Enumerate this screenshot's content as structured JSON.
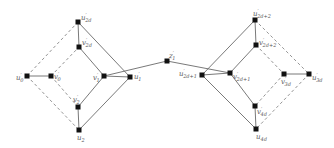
{
  "diagram": {
    "type": "graph",
    "colors": {
      "edge": "#6a6a6a",
      "dashed_edge": "#8a8a8a",
      "node": "#111111",
      "label": "#555555"
    },
    "nodes": [
      {
        "id": "u0p",
        "x": 27,
        "y": 76,
        "label": {
          "base": "u",
          "prime": "′",
          "sub": "0"
        },
        "lx": 16,
        "ly": 80,
        "anchor": "end-ish"
      },
      {
        "id": "v0p",
        "x": 51,
        "y": 76,
        "label": {
          "base": "v",
          "prime": "′",
          "sub": "0"
        },
        "lx": 54,
        "ly": 79
      },
      {
        "id": "u2dp",
        "x": 78,
        "y": 22,
        "label": {
          "base": "u",
          "prime": "′",
          "sub": "2d"
        },
        "lx": 81,
        "ly": 20
      },
      {
        "id": "v2dp",
        "x": 79,
        "y": 47,
        "label": {
          "base": "v",
          "prime": "′",
          "sub": "2d"
        },
        "lx": 82,
        "ly": 45
      },
      {
        "id": "v2p",
        "x": 78,
        "y": 107,
        "label": {
          "base": "v",
          "prime": "′",
          "sub": "2"
        },
        "lx": 73,
        "ly": 102
      },
      {
        "id": "u2",
        "x": 79,
        "y": 130,
        "label": {
          "base": "u",
          "prime": "",
          "sub": "2"
        },
        "lx": 77,
        "ly": 140
      },
      {
        "id": "v1p",
        "x": 104,
        "y": 76,
        "label": {
          "base": "v",
          "prime": "′",
          "sub": "1"
        },
        "lx": 93,
        "ly": 80
      },
      {
        "id": "u1p",
        "x": 130,
        "y": 77,
        "label": {
          "base": "u",
          "prime": "′",
          "sub": "1"
        },
        "lx": 134,
        "ly": 79
      },
      {
        "id": "z1p",
        "x": 167,
        "y": 61,
        "label": {
          "base": "z",
          "prime": "′",
          "sub": "1"
        },
        "lx": 169,
        "ly": 58
      },
      {
        "id": "u2d1p",
        "x": 202,
        "y": 75,
        "label": {
          "base": "u",
          "prime": "′",
          "sub": "2d+1"
        },
        "lx": 179,
        "ly": 76
      },
      {
        "id": "v2d1p",
        "x": 230,
        "y": 73,
        "label": {
          "base": "v",
          "prime": "′",
          "sub": "2d+1"
        },
        "lx": 233,
        "ly": 79
      },
      {
        "id": "u2d2p",
        "x": 255,
        "y": 20,
        "label": {
          "base": "u",
          "prime": "′",
          "sub": "2d+2"
        },
        "lx": 253,
        "ly": 16
      },
      {
        "id": "v2d2p",
        "x": 256,
        "y": 45,
        "label": {
          "base": "v",
          "prime": "′",
          "sub": "2d+2"
        },
        "lx": 259,
        "ly": 45
      },
      {
        "id": "v3dp",
        "x": 284,
        "y": 74,
        "label": {
          "base": "v",
          "prime": "′",
          "sub": "3d"
        },
        "lx": 281,
        "ly": 84
      },
      {
        "id": "u3dp",
        "x": 309,
        "y": 74,
        "label": {
          "base": "u",
          "prime": "′",
          "sub": "3d"
        },
        "lx": 312,
        "ly": 80
      },
      {
        "id": "v4dp",
        "x": 255,
        "y": 106,
        "label": {
          "base": "v",
          "prime": "′",
          "sub": "4d"
        },
        "lx": 257,
        "ly": 114
      },
      {
        "id": "u4d",
        "x": 256,
        "y": 129,
        "label": {
          "base": "u",
          "prime": "",
          "sub": "4d"
        },
        "lx": 256,
        "ly": 139
      }
    ],
    "solid_edges": [
      [
        "u0p",
        "v0p"
      ],
      [
        "u2dp",
        "v2dp"
      ],
      [
        "u2dp",
        "u1p"
      ],
      [
        "v2dp",
        "v1p"
      ],
      [
        "v1p",
        "u1p"
      ],
      [
        "v1p",
        "v2p"
      ],
      [
        "v1p",
        "z1p"
      ],
      [
        "v2p",
        "u2"
      ],
      [
        "u2",
        "u1p"
      ],
      [
        "z1p",
        "v2d1p"
      ],
      [
        "u2d1p",
        "v2d1p"
      ],
      [
        "u2d1p",
        "u2d2p"
      ],
      [
        "u2d2p",
        "v2d2p"
      ],
      [
        "v2d2p",
        "v2d1p"
      ],
      [
        "v2d1p",
        "v4dp"
      ],
      [
        "u2d1p",
        "u4d"
      ],
      [
        "v4dp",
        "u4d"
      ],
      [
        "v3dp",
        "u3dp"
      ]
    ],
    "dashed_edges": [
      [
        "u0p",
        "u2dp"
      ],
      [
        "u0p",
        "u2"
      ],
      [
        "v0p",
        "v2dp"
      ],
      [
        "v0p",
        "v2p"
      ],
      [
        "u2d2p",
        "u3dp"
      ],
      [
        "v2d2p",
        "v3dp"
      ],
      [
        "v3dp",
        "v4dp"
      ],
      [
        "u3dp",
        "u4d"
      ]
    ]
  }
}
